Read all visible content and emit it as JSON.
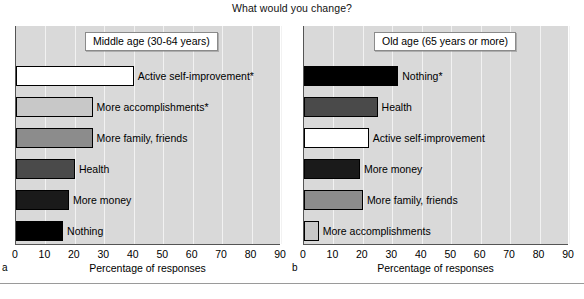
{
  "figure": {
    "title": "What would you change?",
    "axis_title": "Percentage of responses",
    "ticks": [
      0,
      10,
      20,
      30,
      40,
      50,
      60,
      70,
      80,
      90
    ],
    "panel_letters": {
      "left": "a",
      "right": "b"
    }
  },
  "colors": {
    "plot_background": "#d9d9d9",
    "gridline": "#f2f2f2",
    "bar_outline": "#000000",
    "white": "#ffffff",
    "light_gray": "#c8c8c8",
    "mid_gray": "#8c8c8c",
    "dark_gray": "#4a4a4a",
    "near_black": "#1a1a1a",
    "black": "#000000"
  },
  "chart_data": [
    {
      "type": "bar",
      "orientation": "horizontal",
      "panel": "a",
      "title": "Middle age (30-64 years)",
      "xlabel": "Percentage of responses",
      "ylabel": "",
      "xlim": [
        0,
        90
      ],
      "grid": true,
      "categories": [
        "Active self-improvement*",
        "More accomplishments*",
        "More family, friends",
        "Health",
        "More money",
        "Nothing"
      ],
      "values": [
        40,
        26,
        26,
        20,
        18,
        16
      ],
      "bar_colors": [
        "#ffffff",
        "#c8c8c8",
        "#8c8c8c",
        "#4a4a4a",
        "#1a1a1a",
        "#000000"
      ]
    },
    {
      "type": "bar",
      "orientation": "horizontal",
      "panel": "b",
      "title": "Old age (65 years or more)",
      "xlabel": "Percentage of responses",
      "ylabel": "",
      "xlim": [
        0,
        90
      ],
      "grid": true,
      "categories": [
        "Nothing*",
        "Health",
        "Active self-improvement",
        "More money",
        "More family, friends",
        "More accomplishments"
      ],
      "values": [
        32,
        25,
        22,
        19,
        20,
        5
      ],
      "bar_colors": [
        "#000000",
        "#4a4a4a",
        "#ffffff",
        "#1a1a1a",
        "#8c8c8c",
        "#c8c8c8"
      ]
    }
  ]
}
